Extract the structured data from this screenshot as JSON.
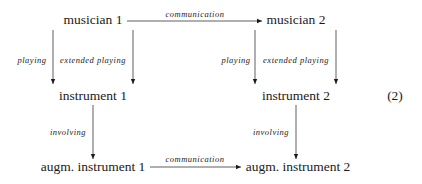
{
  "diagram": {
    "type": "commutative-diagram",
    "equation_number": "(2)",
    "nodes": {
      "musician1": "musician 1",
      "musician2": "musician 2",
      "instrument1": "instrument 1",
      "instrument2": "instrument 2",
      "augm1": "augm. instrument 1",
      "augm2": "augm. instrument 2"
    },
    "edges": {
      "top_comm": "communication",
      "m1_playing": "playing",
      "m1_extended": "extended playing",
      "m2_playing": "playing",
      "m2_extended": "extended playing",
      "i1_involving": "involving",
      "i2_involving": "involving",
      "bottom_comm": "communication"
    },
    "connections": [
      {
        "from": "musician 1",
        "to": "musician 2",
        "label": "communication"
      },
      {
        "from": "musician 1",
        "to": "instrument 1",
        "label": "playing"
      },
      {
        "from": "musician 1",
        "to": "instrument 1",
        "label": "extended playing"
      },
      {
        "from": "musician 2",
        "to": "instrument 2",
        "label": "playing"
      },
      {
        "from": "musician 2",
        "to": "instrument 2",
        "label": "extended playing"
      },
      {
        "from": "instrument 1",
        "to": "augm. instrument 1",
        "label": "involving"
      },
      {
        "from": "instrument 2",
        "to": "augm. instrument 2",
        "label": "involving"
      },
      {
        "from": "augm. instrument 1",
        "to": "augm. instrument 2",
        "label": "communication"
      }
    ],
    "colors": {
      "ink": "#1a1a1a",
      "background": "#ffffff"
    }
  }
}
